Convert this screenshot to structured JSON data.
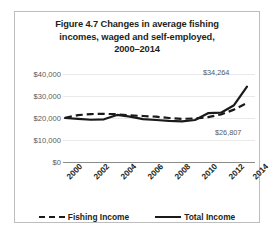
{
  "figure": {
    "title_lines": [
      "Figure 4.7 Changes in average fishing",
      "incomes, waged and self-employed,",
      "2000–2014"
    ]
  },
  "chart_data": {
    "type": "line",
    "title": "Figure 4.7 Changes in average fishing incomes, waged and self-employed, 2000–2014",
    "xlabel": "",
    "ylabel": "",
    "x": [
      2000,
      2001,
      2002,
      2003,
      2004,
      2005,
      2006,
      2007,
      2008,
      2009,
      2010,
      2011,
      2012,
      2013,
      2014
    ],
    "tick_labels": [
      "2000",
      "2002",
      "2004",
      "2006",
      "2008",
      "2010",
      "2012",
      "2014"
    ],
    "ytick_labels": [
      "$40,000",
      "$30,000",
      "$20,000",
      "$10,000",
      "$0"
    ],
    "yticks": [
      40000,
      30000,
      20000,
      10000,
      0
    ],
    "ylim": [
      0,
      45000
    ],
    "grid": true,
    "legend_position": "bottom",
    "series": [
      {
        "name": "Fishing Income",
        "style": "dashed",
        "color": "#1a1a1a",
        "values": [
          20100,
          21300,
          21800,
          21900,
          21700,
          21200,
          20900,
          20600,
          20000,
          19600,
          19800,
          20400,
          21600,
          23800,
          26807
        ],
        "end_label": "$26,807"
      },
      {
        "name": "Total Income",
        "style": "solid",
        "color": "#1a1a1a",
        "values": [
          20000,
          19600,
          19200,
          19400,
          21400,
          20600,
          19500,
          19100,
          18700,
          18500,
          19100,
          22200,
          22400,
          25800,
          34264
        ],
        "end_label": "$34,264"
      }
    ],
    "annotations": [
      {
        "text": "$34,264",
        "series": "Total Income",
        "x": 2014
      },
      {
        "text": "$26,807",
        "series": "Fishing Income",
        "x": 2014
      }
    ]
  }
}
